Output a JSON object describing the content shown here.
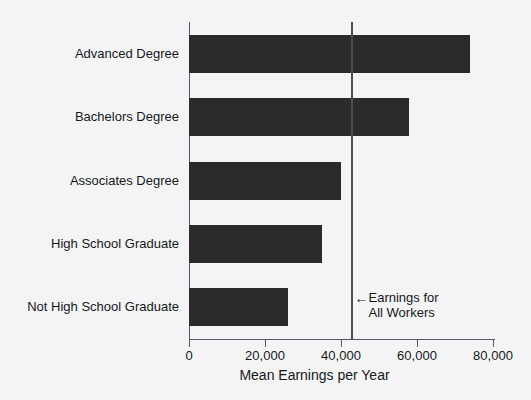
{
  "chart_data": {
    "type": "bar",
    "orientation": "horizontal",
    "title": "",
    "xlabel": "Mean Earnings per Year",
    "ylabel": "",
    "categories": [
      "Advanced Degree",
      "Bachelors Degree",
      "Associates Degree",
      "High School Graduate",
      "Not High School Graduate"
    ],
    "values": [
      74000,
      58000,
      40000,
      35000,
      26000
    ],
    "xlim": [
      0,
      80000
    ],
    "xticks": [
      0,
      20000,
      40000,
      60000,
      80000
    ],
    "xtick_labels": [
      "0",
      "20,000",
      "40,000",
      "60,000",
      "80,000"
    ],
    "grid": false,
    "legend": "none",
    "bar_color": "#2b2b2d",
    "background_color": "#f4f4f6",
    "axis_color": "#555a60",
    "annotations": [
      {
        "name": "earnings-for-all-workers",
        "value": 42500,
        "arrow": "←",
        "line1": "Earnings for",
        "line2": "All Workers"
      }
    ]
  },
  "axis": {
    "x_title": "Mean Earnings per Year"
  }
}
